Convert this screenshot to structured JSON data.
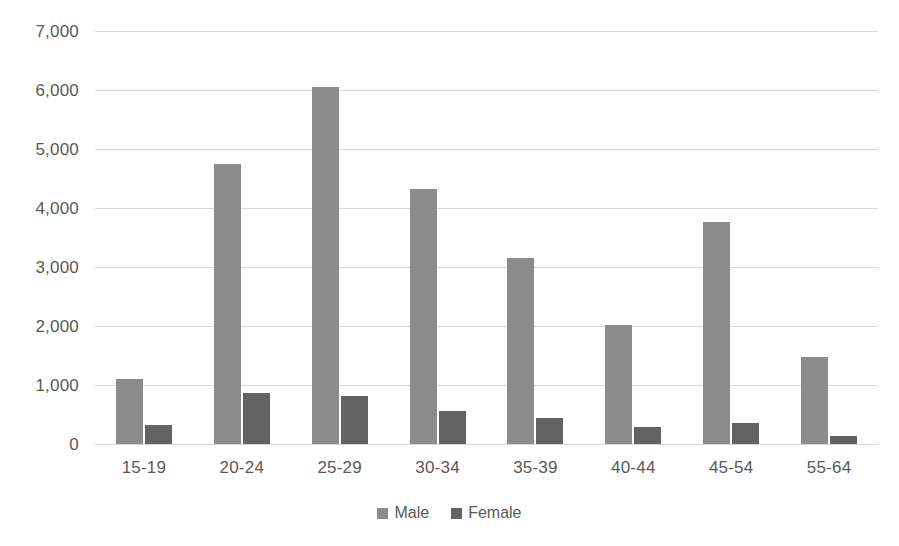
{
  "chart_data": {
    "type": "bar",
    "title": "",
    "subtitle": "",
    "xlabel": "",
    "ylabel": "",
    "categories": [
      "15-19",
      "20-24",
      "25-29",
      "30-34",
      "35-39",
      "40-44",
      "45-54",
      "55-64"
    ],
    "series": [
      {
        "name": "Male",
        "color": "#8c8c8c",
        "values": [
          1100,
          4750,
          6050,
          4320,
          3160,
          2010,
          3770,
          1470
        ]
      },
      {
        "name": "Female",
        "color": "#636363",
        "values": [
          330,
          870,
          820,
          560,
          440,
          290,
          350,
          140
        ]
      }
    ],
    "ylim": [
      0,
      7000
    ],
    "y_ticks": [
      0,
      1000,
      2000,
      3000,
      4000,
      5000,
      6000,
      7000
    ],
    "y_tick_labels": [
      "0",
      "1,000",
      "2,000",
      "3,000",
      "4,000",
      "5,000",
      "6,000",
      "7,000"
    ],
    "grid": true,
    "grid_axis": "y",
    "grid_color": "#d9d9d9",
    "legend_position": "bottom",
    "background_color": "#ffffff",
    "text_color": "#595959"
  }
}
